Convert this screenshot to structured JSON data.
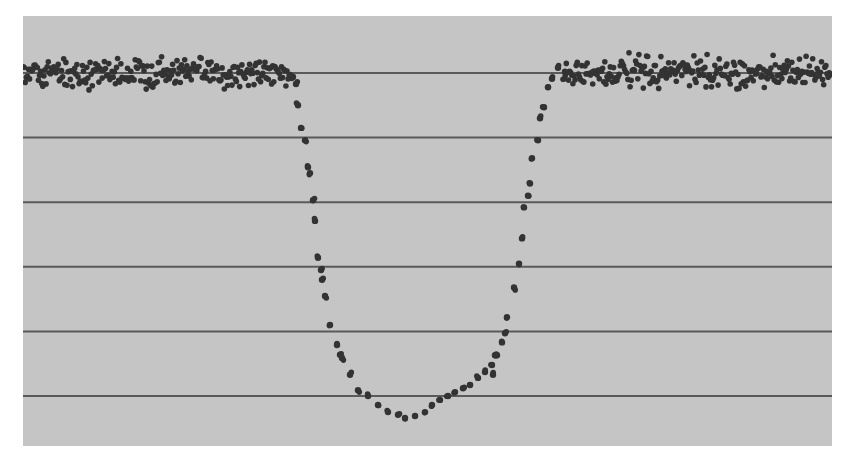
{
  "chart_data": {
    "type": "scatter",
    "title": "",
    "xlabel": "",
    "ylabel": "",
    "grid": true,
    "gridlines_y": [
      0,
      -1,
      -2,
      -3,
      -4,
      -5
    ],
    "xlim": [
      0,
      809
    ],
    "ylim": [
      0.88,
      -5.79
    ],
    "legend": null,
    "colors": {
      "plot_background": "#c5c5c5",
      "gridline": "#5a5a5a",
      "marker": "#333333",
      "page_background": "#ffffff"
    },
    "baseline_level": 0,
    "min_level": -5.34,
    "dip_start_x": 268,
    "dip_end_x": 540,
    "dip_center_x": 385,
    "series": [
      {
        "name": "left-descent",
        "points": [
          [
            270,
            -0.06
          ],
          [
            273,
            -0.17
          ],
          [
            275,
            -0.5
          ],
          [
            278,
            -0.85
          ],
          [
            282,
            -1.04
          ],
          [
            285,
            -1.46
          ],
          [
            287,
            -1.55
          ],
          [
            290,
            -1.97
          ],
          [
            292,
            -2.29
          ],
          [
            295,
            -2.86
          ],
          [
            298,
            -3.05
          ],
          [
            299,
            -3.2
          ],
          [
            302,
            -3.45
          ],
          [
            307,
            -3.9
          ],
          [
            314,
            -4.21
          ],
          [
            317,
            -4.36
          ]
        ]
      },
      {
        "name": "dip-bottom",
        "points": [
          [
            319,
            -4.41
          ],
          [
            327,
            -4.67
          ],
          [
            335,
            -4.91
          ],
          [
            345,
            -5.0
          ],
          [
            355,
            -5.14
          ],
          [
            365,
            -5.25
          ],
          [
            375,
            -5.29
          ],
          [
            382,
            -5.34
          ],
          [
            392,
            -5.31
          ],
          [
            402,
            -5.25
          ],
          [
            409,
            -5.14
          ],
          [
            417,
            -5.06
          ],
          [
            425,
            -5.0
          ],
          [
            432,
            -4.94
          ],
          [
            440,
            -4.88
          ],
          [
            447,
            -4.83
          ],
          [
            455,
            -4.72
          ],
          [
            462,
            -4.63
          ],
          [
            469,
            -4.52
          ],
          [
            474,
            -4.37
          ]
        ]
      },
      {
        "name": "right-ascent",
        "points": [
          [
            470,
            -4.67
          ],
          [
            472,
            -4.37
          ],
          [
            479,
            -4.17
          ],
          [
            482,
            -4.03
          ],
          [
            484,
            -3.78
          ],
          [
            491,
            -3.32
          ],
          [
            496,
            -2.95
          ],
          [
            499,
            -2.56
          ],
          [
            501,
            -2.08
          ],
          [
            505,
            -1.9
          ],
          [
            507,
            -1.71
          ],
          [
            509,
            -1.32
          ],
          [
            515,
            -1.04
          ],
          [
            517,
            -0.7
          ],
          [
            521,
            -0.53
          ],
          [
            525,
            -0.22
          ],
          [
            529,
            -0.09
          ],
          [
            535,
            0.08
          ],
          [
            542,
            0.02
          ]
        ]
      },
      {
        "name": "baseline-left",
        "x_range": [
          0,
          268
        ],
        "level": 0,
        "scatter": 0.2
      },
      {
        "name": "baseline-right",
        "x_range": [
          540,
          809
        ],
        "level": 0,
        "scatter": 0.2
      }
    ]
  }
}
